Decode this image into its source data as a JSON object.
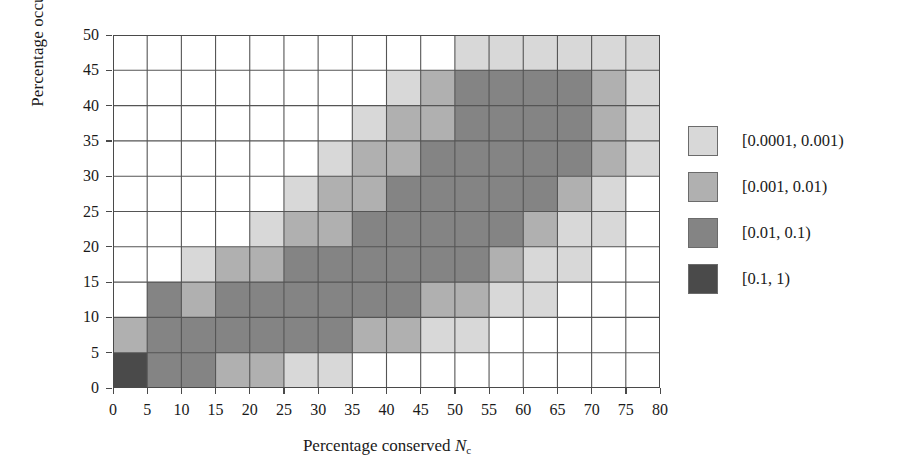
{
  "chart_data": {
    "type": "heatmap",
    "title": "",
    "xlabel": "Percentage conserved N_c",
    "ylabel": "Percentage occupied N_o",
    "xlabel_text": "Percentage conserved",
    "xlabel_var": "N",
    "xlabel_sub": "c",
    "ylabel_text": "Percentage occupied",
    "ylabel_var": "N",
    "ylabel_sub": "o",
    "xlim": [
      0,
      80
    ],
    "ylim": [
      0,
      50
    ],
    "xticks": [
      0,
      5,
      10,
      15,
      20,
      25,
      30,
      35,
      40,
      45,
      50,
      55,
      60,
      65,
      70,
      75,
      80
    ],
    "yticks": [
      0,
      5,
      10,
      15,
      20,
      25,
      30,
      35,
      40,
      45,
      50
    ],
    "grid": true,
    "cell_size": 5,
    "x_bin_starts": [
      0,
      5,
      10,
      15,
      20,
      25,
      30,
      35,
      40,
      45,
      50,
      55,
      60,
      65,
      70,
      75
    ],
    "y_bin_starts": [
      0,
      5,
      10,
      15,
      20,
      25,
      30,
      35,
      40,
      45
    ],
    "legend_position": "right",
    "bins": [
      {
        "level": 0,
        "label": "",
        "color": "#ffffff",
        "range": "below 0.0001"
      },
      {
        "level": 1,
        "label": "[0.0001, 0.001)",
        "color": "#d8d8d8"
      },
      {
        "level": 2,
        "label": "[0.001, 0.01)",
        "color": "#b0b0b0"
      },
      {
        "level": 3,
        "label": "[0.01, 0.1)",
        "color": "#848484"
      },
      {
        "level": 4,
        "label": "[0.1, 1)",
        "color": "#4a4a4a"
      }
    ],
    "levels_note": "rows listed bottom (N_o=0-5) to top (N_o=45-50); each row has 16 values for N_c = 0-5 .. 75-80; 0 = blank/white",
    "levels": [
      [
        4,
        3,
        3,
        2,
        2,
        1,
        1,
        0,
        0,
        0,
        0,
        0,
        0,
        0,
        0,
        0
      ],
      [
        2,
        3,
        3,
        3,
        3,
        3,
        3,
        2,
        2,
        1,
        1,
        0,
        0,
        0,
        0,
        0
      ],
      [
        0,
        3,
        2,
        3,
        3,
        3,
        3,
        3,
        3,
        2,
        2,
        1,
        1,
        0,
        0,
        0
      ],
      [
        0,
        0,
        1,
        2,
        2,
        3,
        3,
        3,
        3,
        3,
        3,
        2,
        1,
        1,
        0,
        0
      ],
      [
        0,
        0,
        0,
        0,
        1,
        2,
        2,
        3,
        3,
        3,
        3,
        3,
        2,
        1,
        1,
        0
      ],
      [
        0,
        0,
        0,
        0,
        0,
        1,
        2,
        2,
        3,
        3,
        3,
        3,
        3,
        2,
        1,
        0
      ],
      [
        0,
        0,
        0,
        0,
        0,
        0,
        1,
        2,
        2,
        3,
        3,
        3,
        3,
        3,
        2,
        1
      ],
      [
        0,
        0,
        0,
        0,
        0,
        0,
        0,
        1,
        2,
        2,
        3,
        3,
        3,
        3,
        2,
        1
      ],
      [
        0,
        0,
        0,
        0,
        0,
        0,
        0,
        0,
        1,
        2,
        3,
        3,
        3,
        3,
        2,
        1
      ],
      [
        0,
        0,
        0,
        0,
        0,
        0,
        0,
        0,
        0,
        0,
        1,
        1,
        1,
        1,
        1,
        1
      ]
    ]
  },
  "legend": {
    "items": [
      {
        "label": "[0.0001, 0.001)",
        "color": "#d8d8d8"
      },
      {
        "label": "[0.001, 0.01)",
        "color": "#b0b0b0"
      },
      {
        "label": "[0.01, 0.1)",
        "color": "#848484"
      },
      {
        "label": "[0.1, 1)",
        "color": "#4a4a4a"
      }
    ]
  },
  "axes": {
    "x_title_words": "Percentage conserved",
    "x_title_symbol": "N",
    "x_title_subscript": "c",
    "y_title_words": "Percentage occupied",
    "y_title_symbol": "N",
    "y_title_subscript": "o"
  },
  "style": {
    "grid_line_color": "#555555",
    "axis_color": "#4a4a4a",
    "background": "#ffffff"
  }
}
